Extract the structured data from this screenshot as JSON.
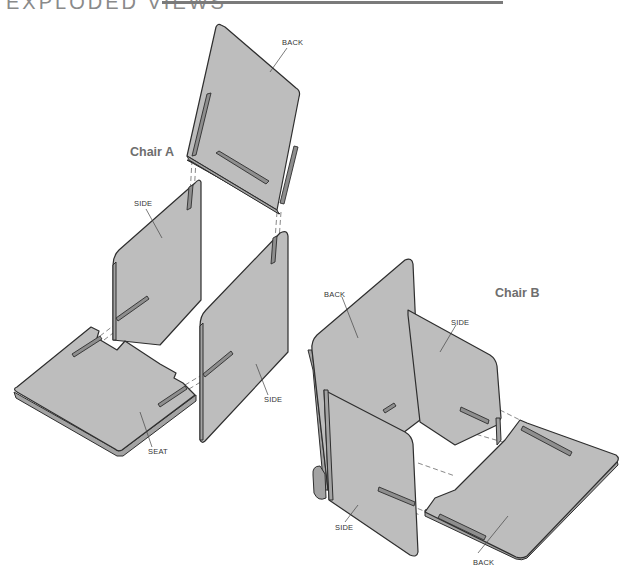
{
  "page": {
    "heading": "EXPLODED VIEWS"
  },
  "chair_a": {
    "title": "Chair A",
    "labels": {
      "back": "BACK",
      "side_left": "SIDE",
      "side_right": "SIDE",
      "seat": "SEAT"
    }
  },
  "chair_b": {
    "title": "Chair B",
    "labels": {
      "back_upright": "BACK",
      "side_rear": "SIDE",
      "side_front": "SIDE",
      "back_flat": "BACK"
    }
  },
  "colors": {
    "panel_fill": "#bdbdbd",
    "outline": "#2e2e2e",
    "title_text": "#6e6e6e"
  }
}
